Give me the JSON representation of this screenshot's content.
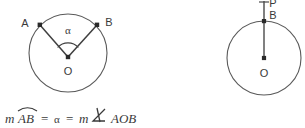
{
  "figure": {
    "background_color": "#ffffff",
    "stroke_color": "#5a5a5a",
    "text_color": "#3a3a3a",
    "left_diagram": {
      "name": "central-angle-circle",
      "circle": {
        "cx": 68,
        "cy": 53,
        "r": 39
      },
      "center_point": {
        "label": "O",
        "x": 68,
        "y": 57
      },
      "center_label_pos": {
        "x": 68,
        "y": 72
      },
      "point_a": {
        "label": "A",
        "x": 40,
        "y": 25
      },
      "point_a_label_pos": {
        "x": 25,
        "y": 23
      },
      "point_b": {
        "label": "B",
        "x": 97,
        "y": 25
      },
      "point_b_label_pos": {
        "x": 108,
        "y": 22
      },
      "angle_label": {
        "label": "α",
        "x": 68,
        "y": 31
      },
      "angle_arc_radius": 14
    },
    "right_diagram": {
      "name": "tangent-radius-circle",
      "circle": {
        "cx": 264,
        "cy": 58,
        "r": 37
      },
      "center_point": {
        "label": "O",
        "x": 264,
        "y": 58
      },
      "center_label_pos": {
        "x": 264,
        "y": 74
      },
      "point_b": {
        "label": "B",
        "x": 264,
        "y": 21
      },
      "point_b_label_pos": {
        "x": 272,
        "y": 17
      },
      "point_p": {
        "label": "P",
        "x": 264,
        "y": 2
      },
      "point_p_label_pos": {
        "x": 272,
        "y": 5
      },
      "radius_line": {
        "x1": 264,
        "y1": 58,
        "x2": 264,
        "y2": 2
      }
    },
    "equation": {
      "full_text": "m AB = α = m ∡ AOB",
      "segments": {
        "m1": "m",
        "arc_ab": "AB",
        "equals1": "=",
        "alpha": "α",
        "equals2": "=",
        "m2": "m",
        "angle_symbol": "∡",
        "aob": "AOB"
      },
      "position": {
        "x": 5,
        "baseline_y": 122
      }
    }
  }
}
